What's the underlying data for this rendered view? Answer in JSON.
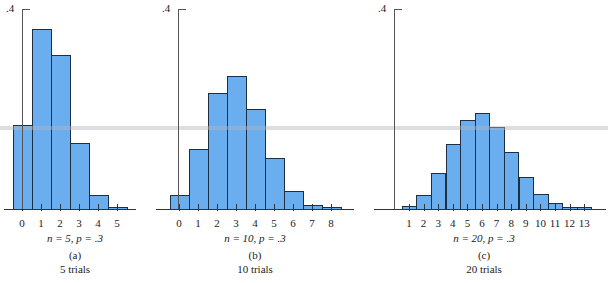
{
  "chart_data": [
    {
      "type": "bar",
      "title": "",
      "xlabel": "n = 5, p = .3",
      "panel_label": "(a)",
      "subtitle": "5 trials",
      "ylabel": "",
      "ylim": [
        0,
        0.4
      ],
      "y_tick_labels": [
        ".4"
      ],
      "categories": [
        "0",
        "1",
        "2",
        "3",
        "4",
        "5"
      ],
      "values": [
        0.168,
        0.36,
        0.309,
        0.132,
        0.028,
        0.002
      ],
      "grid": false
    },
    {
      "type": "bar",
      "title": "",
      "xlabel": "n = 10, p = .3",
      "panel_label": "(b)",
      "subtitle": "10 trials",
      "ylabel": "",
      "ylim": [
        0,
        0.4
      ],
      "y_tick_labels": [
        ".4"
      ],
      "categories": [
        "0",
        "1",
        "2",
        "3",
        "4",
        "5",
        "6",
        "7",
        "8"
      ],
      "values": [
        0.028,
        0.121,
        0.233,
        0.267,
        0.2,
        0.103,
        0.037,
        0.009,
        0.001
      ],
      "grid": false
    },
    {
      "type": "bar",
      "title": "",
      "xlabel": "n = 20, p = .3",
      "panel_label": "(c)",
      "subtitle": "20 trials",
      "ylabel": "",
      "ylim": [
        0,
        0.4
      ],
      "y_tick_labels": [
        ".4"
      ],
      "categories": [
        "1",
        "2",
        "3",
        "4",
        "5",
        "6",
        "7",
        "8",
        "9",
        "10",
        "11",
        "12",
        "13"
      ],
      "values": [
        0.007,
        0.028,
        0.072,
        0.13,
        0.179,
        0.192,
        0.164,
        0.114,
        0.065,
        0.031,
        0.012,
        0.004,
        0.001
      ],
      "grid": false
    }
  ],
  "colors": {
    "bar_fill": "#6aaef0",
    "bar_edge": "#1d2f45",
    "axis": "#333333"
  },
  "panels": [
    {
      "ytick": ".4",
      "param": "n = 5, p = .3",
      "label": "(a)",
      "subtitle": "5 trials"
    },
    {
      "ytick": ".4",
      "param": "n = 10, p = .3",
      "label": "(b)",
      "subtitle": "10 trials"
    },
    {
      "ytick": ".4",
      "param": "n = 20, p = .3",
      "label": "(c)",
      "subtitle": "20 trials"
    }
  ]
}
